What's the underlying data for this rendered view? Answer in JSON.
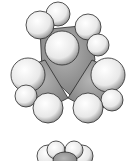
{
  "figure": {
    "colors": {
      "background": "#ffffff",
      "hydrogen_fill": "#f2f2f2",
      "carbon_fill": "#9a9a9a",
      "outline": "#2a2a2a"
    }
  }
}
